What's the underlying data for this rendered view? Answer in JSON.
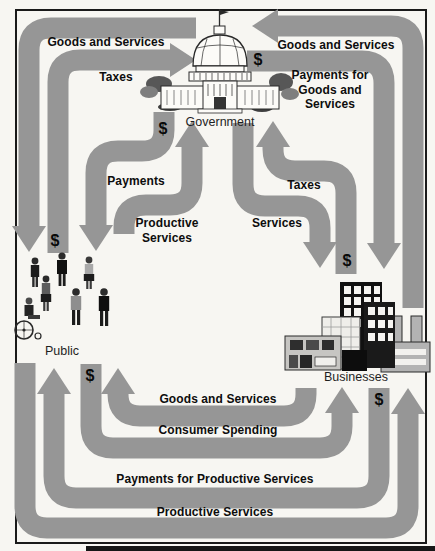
{
  "diagram_type": "circular-flow-of-economic-activity",
  "currency": {
    "symbol": "$"
  },
  "entities": {
    "government": {
      "label": "Government"
    },
    "public": {
      "label": "Public"
    },
    "businesses": {
      "label": "Businesses"
    }
  },
  "flows": [
    {
      "label": "Goods and Services",
      "from": "Government",
      "to": "Public",
      "money": false
    },
    {
      "label": "Taxes",
      "from": "Public",
      "to": "Government",
      "money": true
    },
    {
      "label": "Payments",
      "from": "Government",
      "to": "Public",
      "money": true
    },
    {
      "label": "Productive Services",
      "from": "Public",
      "to": "Government",
      "money": false
    },
    {
      "label": "Taxes",
      "from": "Businesses",
      "to": "Government",
      "money": true
    },
    {
      "label": "Services",
      "from": "Government",
      "to": "Businesses",
      "money": false
    },
    {
      "label": "Goods and Services",
      "from": "Businesses",
      "to": "Government",
      "money": false
    },
    {
      "label": "Payments for Goods and Services",
      "from": "Government",
      "to": "Businesses",
      "money": true
    },
    {
      "label": "Goods and Services",
      "from": "Businesses",
      "to": "Public",
      "money": false
    },
    {
      "label": "Consumer Spending",
      "from": "Public",
      "to": "Businesses",
      "money": true
    },
    {
      "label": "Payments for Productive Services",
      "from": "Businesses",
      "to": "Public",
      "money": true
    },
    {
      "label": "Productive Services",
      "from": "Public",
      "to": "Businesses",
      "money": false
    }
  ],
  "colors": {
    "band": "#969696",
    "label_text": "#0d0d0d",
    "background": "#f7f6f2",
    "frame": "#1a1a1a"
  }
}
